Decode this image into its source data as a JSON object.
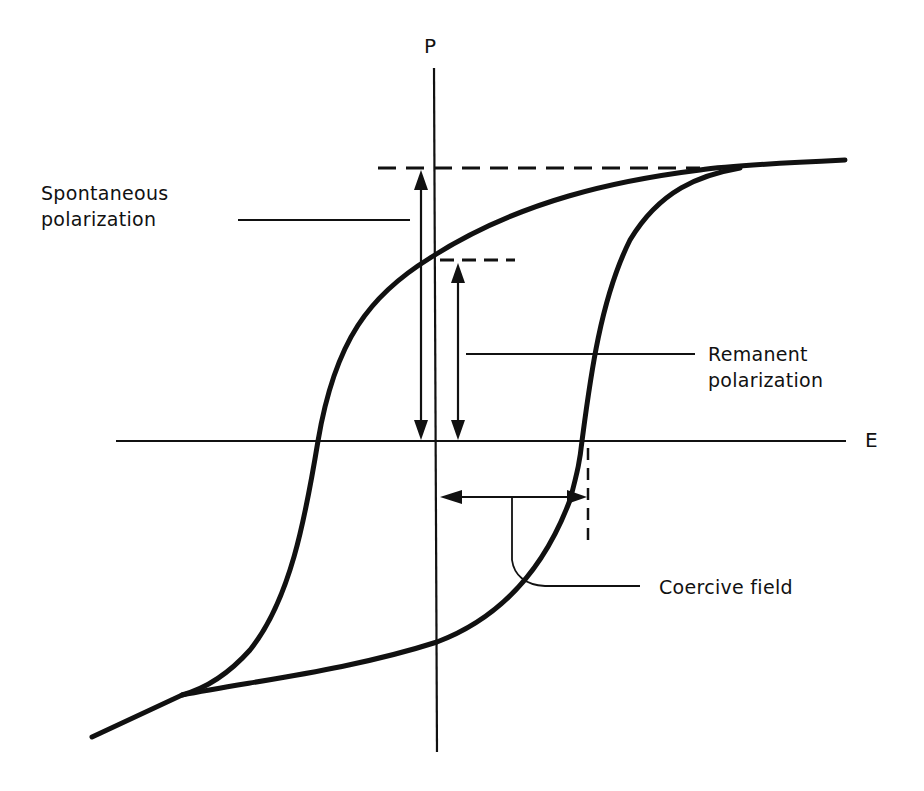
{
  "figure": {
    "type": "ferroelectric hysteresis loop",
    "axes": {
      "vertical": "P",
      "horizontal": "E"
    },
    "annotations": {
      "spontaneous_polarization": {
        "line1": "Spontaneous",
        "line2": "polarization"
      },
      "remanent_polarization": {
        "line1": "Remanent",
        "line2": "polarization"
      },
      "coercive_field": "Coercive field"
    },
    "colors": {
      "ink": "#111111",
      "background": "#ffffff"
    }
  }
}
